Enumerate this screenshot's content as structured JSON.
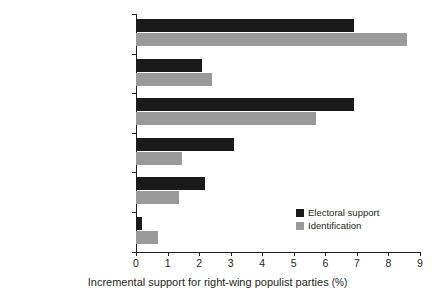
{
  "chart_data": {
    "type": "bar",
    "orientation": "horizontal",
    "title": "",
    "xlabel": "Incremental support for right-wing populist parties (%)",
    "ylabel": "",
    "xlim": [
      0,
      9
    ],
    "xticks": [
      0,
      1,
      2,
      3,
      4,
      5,
      6,
      7,
      8,
      9
    ],
    "xtick_labels": [
      "0",
      "1",
      "2",
      "3",
      "4",
      "5",
      "6",
      "7",
      "8",
      "9"
    ],
    "grid": false,
    "legend_position": "inside lower right",
    "categories": [
      "Conservative ideology",
      "Anti-EU sentiment",
      "Anti-immigrant sentiment",
      "Political distrust",
      "Democratic disaffection",
      "Economic disaffection"
    ],
    "series": [
      {
        "name": "Electoral support",
        "color": "#1a1a1a",
        "values": [
          6.9,
          2.1,
          6.9,
          3.1,
          2.2,
          0.2
        ]
      },
      {
        "name": "Identification",
        "color": "#9a9a9a",
        "values": [
          8.6,
          2.4,
          5.7,
          1.45,
          1.35,
          0.7
        ]
      }
    ]
  },
  "axis": {
    "x_title_main": "Incremental support for right-wing populist parties",
    "x_title_unit": "(%)"
  },
  "legend": {
    "items": [
      {
        "label": "Electoral support",
        "color": "#1a1a1a",
        "swatch": "dark"
      },
      {
        "label": "Identification",
        "color": "#9a9a9a",
        "swatch": "light"
      }
    ]
  }
}
